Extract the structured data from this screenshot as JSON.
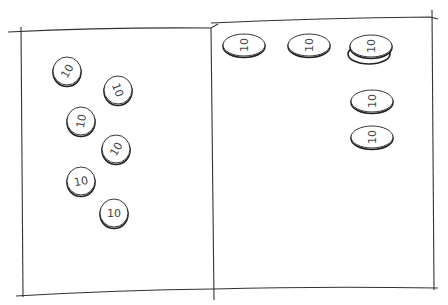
{
  "sketch": {
    "left_box": {
      "coins": [
        {
          "label": "10",
          "x": 67,
          "y": 71,
          "rotation": -60
        },
        {
          "label": "10",
          "x": 118,
          "y": 90,
          "rotation": 70
        },
        {
          "label": "10",
          "x": 81,
          "y": 121,
          "rotation": -80
        },
        {
          "label": "10",
          "x": 116,
          "y": 149,
          "rotation": -60
        },
        {
          "label": "10",
          "x": 81,
          "y": 181,
          "rotation": -10
        },
        {
          "label": "10",
          "x": 114,
          "y": 213,
          "rotation": 0
        }
      ]
    },
    "right_box": {
      "coins": [
        {
          "label": "10",
          "x": 244,
          "y": 45,
          "stacked": false
        },
        {
          "label": "10",
          "x": 309,
          "y": 45,
          "stacked": false
        },
        {
          "label": "10",
          "x": 371,
          "y": 46,
          "stacked": true
        },
        {
          "label": "10",
          "x": 372,
          "y": 101,
          "stacked": false
        },
        {
          "label": "10",
          "x": 372,
          "y": 137,
          "stacked": false
        }
      ]
    },
    "stroke_color": "#222222"
  }
}
